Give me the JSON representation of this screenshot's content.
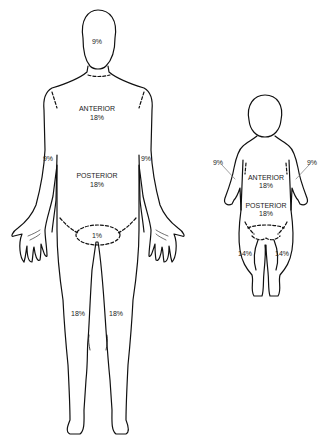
{
  "diagram": {
    "adult": {
      "head": "9%",
      "trunk_anterior": {
        "label": "ANTERIOR",
        "value": "18%"
      },
      "trunk_posterior": {
        "label": "POSTERIOR",
        "value": "18%"
      },
      "left_arm": "9%",
      "right_arm": "9%",
      "genitals": "1%",
      "left_leg": "18%",
      "right_leg": "18%"
    },
    "child": {
      "left_arm": "9%",
      "right_arm": "9%",
      "trunk_anterior": {
        "label": "ANTERIOR",
        "value": "18%"
      },
      "trunk_posterior": {
        "label": "POSTERIOR",
        "value": "18%"
      },
      "left_leg": "14%",
      "right_leg": "14%"
    },
    "colors": {
      "line": "#111111",
      "text": "#222222",
      "background": "#ffffff"
    }
  }
}
